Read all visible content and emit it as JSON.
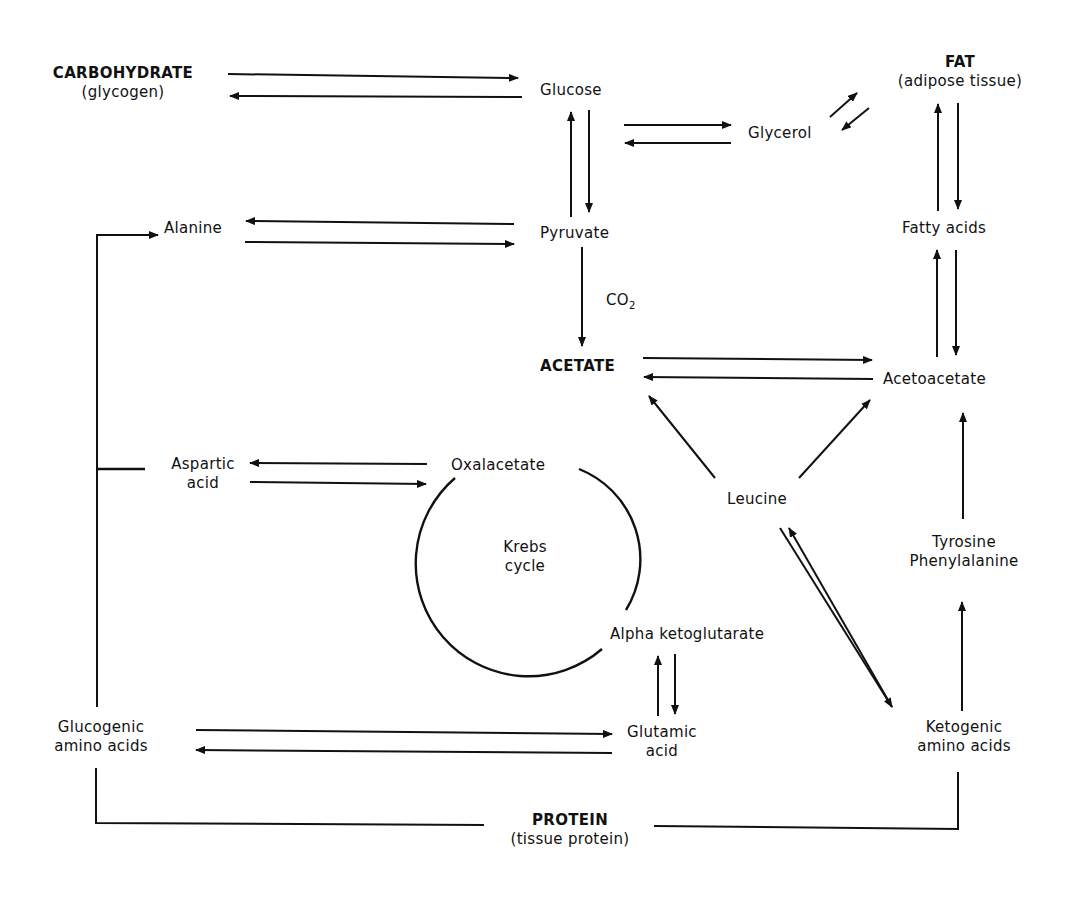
{
  "nodes": {
    "carbohydrate": {
      "title": "CARBOHYDRATE",
      "subtitle": "(glycogen)"
    },
    "glucose": {
      "label": "Glucose"
    },
    "glycerol": {
      "label": "Glycerol"
    },
    "fat": {
      "title": "FAT",
      "subtitle": "(adipose tissue)"
    },
    "alanine": {
      "label": "Alanine"
    },
    "pyruvate": {
      "label": "Pyruvate"
    },
    "fatty_acids": {
      "label": "Fatty acids"
    },
    "co2": {
      "label": "CO",
      "sub": "2"
    },
    "acetate": {
      "label": "ACETATE"
    },
    "acetoacetate": {
      "label": "Acetoacetate"
    },
    "aspartic_acid": {
      "line1": "Aspartic",
      "line2": "acid"
    },
    "oxalacetate": {
      "label": "Oxalacetate"
    },
    "leucine": {
      "label": "Leucine"
    },
    "krebs": {
      "line1": "Krebs",
      "line2": "cycle"
    },
    "tyrosine": {
      "line1": "Tyrosine",
      "line2": "Phenylalanine"
    },
    "alpha_kg": {
      "label": "Alpha ketoglutarate"
    },
    "glucogenic": {
      "line1": "Glucogenic",
      "line2": "amino acids"
    },
    "glutamic": {
      "line1": "Glutamic",
      "line2": "acid"
    },
    "ketogenic": {
      "line1": "Ketogenic",
      "line2": "amino acids"
    },
    "protein": {
      "title": "PROTEIN",
      "subtitle": "(tissue protein)"
    }
  },
  "edges": [
    {
      "from": "CARBOHYDRATE",
      "to": "Glucose",
      "bidirectional": true
    },
    {
      "from": "Glucose",
      "to": "Pyruvate",
      "bidirectional": true
    },
    {
      "from": "Glucose",
      "to": "Glycerol",
      "bidirectional": true
    },
    {
      "from": "Glycerol",
      "to": "FAT",
      "bidirectional": true
    },
    {
      "from": "FAT",
      "to": "Fatty acids",
      "bidirectional": true
    },
    {
      "from": "Alanine",
      "to": "Pyruvate",
      "bidirectional": true
    },
    {
      "from": "Pyruvate",
      "to": "ACETATE",
      "label": "CO2"
    },
    {
      "from": "Fatty acids",
      "to": "Acetoacetate",
      "bidirectional": true
    },
    {
      "from": "ACETATE",
      "to": "Acetoacetate",
      "bidirectional": true
    },
    {
      "from": "Leucine",
      "to": "ACETATE"
    },
    {
      "from": "Leucine",
      "to": "Acetoacetate"
    },
    {
      "from": "Leucine",
      "to": "Ketogenic amino acids",
      "bidirectional": true
    },
    {
      "from": "Tyrosine Phenylalanine",
      "to": "Acetoacetate"
    },
    {
      "from": "Ketogenic amino acids",
      "to": "Tyrosine Phenylalanine"
    },
    {
      "from": "Aspartic acid",
      "to": "Oxalacetate",
      "bidirectional": true
    },
    {
      "from": "Alpha ketoglutarate",
      "to": "Glutamic acid",
      "bidirectional": true
    },
    {
      "from": "Glucogenic amino acids",
      "to": "Glutamic acid",
      "bidirectional": true
    },
    {
      "from": "Glucogenic amino acids",
      "to": "Alanine"
    },
    {
      "from": "Glucogenic amino acids",
      "to": "Aspartic acid"
    },
    {
      "from": "PROTEIN",
      "to": "Glucogenic amino acids"
    },
    {
      "from": "PROTEIN",
      "to": "Ketogenic amino acids"
    }
  ]
}
